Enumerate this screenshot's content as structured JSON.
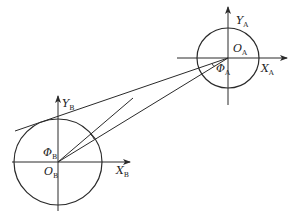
{
  "diagram": {
    "type": "geometry",
    "colors": {
      "line": "#2a2a2a",
      "background": "#ffffff",
      "text": "#222222"
    },
    "frames": {
      "A": {
        "origin_label": {
          "main": "O",
          "sub": "A"
        },
        "x_label": {
          "main": "X",
          "sub": "A"
        },
        "y_label": {
          "main": "Y",
          "sub": "A"
        },
        "angle_label": {
          "main": "Φ",
          "sub": "A"
        }
      },
      "B": {
        "origin_label": {
          "main": "O",
          "sub": "B"
        },
        "x_label": {
          "main": "X",
          "sub": "B"
        },
        "y_label": {
          "main": "Y",
          "sub": "B"
        },
        "angle_label": {
          "main": "Φ",
          "sub": "B"
        }
      }
    }
  }
}
